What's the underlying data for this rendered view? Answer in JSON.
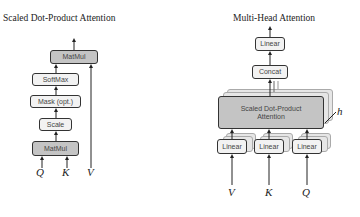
{
  "left_diagram": {
    "title": "Scaled Dot-Product Attention",
    "boxes": {
      "matmul_top": "MatMul",
      "softmax": "SoftMax",
      "mask": "Mask (opt.)",
      "scale": "Scale",
      "matmul_bottom": "MatMul"
    },
    "inputs": {
      "q": "Q",
      "k": "K",
      "v": "V"
    }
  },
  "right_diagram": {
    "title": "Multi-Head Attention",
    "boxes": {
      "linear_top": "Linear",
      "concat": "Concat",
      "sdpa_line1": "Scaled Dot-Product",
      "sdpa_line2": "Attention",
      "linear_v": "Linear",
      "linear_k": "Linear",
      "linear_q": "Linear"
    },
    "heads_label": "h",
    "inputs": {
      "v": "V",
      "k": "K",
      "q": "Q"
    }
  },
  "colors": {
    "dark_box": "#c4c4c4",
    "light_box": "#f2f2f2",
    "stroke": "#333333"
  }
}
